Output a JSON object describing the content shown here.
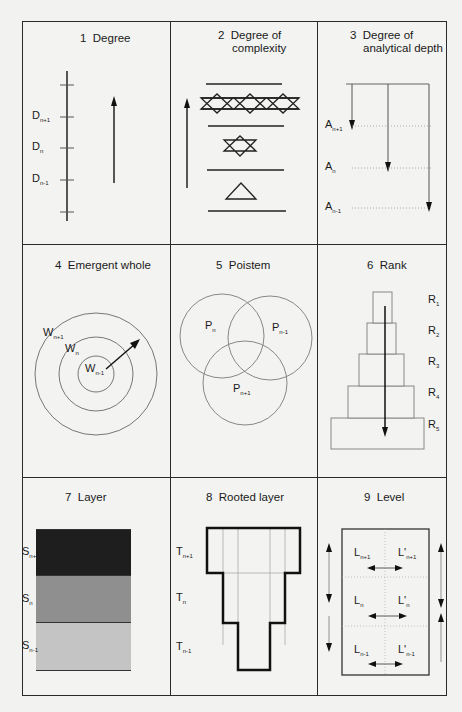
{
  "figure": {
    "panels": [
      {
        "id": 1,
        "title": "1  Degree",
        "labels": [
          {
            "base": "D",
            "sub": "n+1"
          },
          {
            "base": "D",
            "sub": "n"
          },
          {
            "base": "D",
            "sub": "n-1"
          }
        ]
      },
      {
        "id": 2,
        "title_line1": "2  Degree of",
        "title_line2": "complexity"
      },
      {
        "id": 3,
        "title_line1": "3  Degree of",
        "title_line2": "analytical depth",
        "labels": [
          {
            "base": "A",
            "sub": "n+1"
          },
          {
            "base": "A",
            "sub": "n"
          },
          {
            "base": "A",
            "sub": "n-1"
          }
        ]
      },
      {
        "id": 4,
        "title": "4  Emergent whole",
        "labels": [
          {
            "base": "W",
            "sub": "n+1"
          },
          {
            "base": "W",
            "sub": "n"
          },
          {
            "base": "W",
            "sub": "n-1"
          }
        ]
      },
      {
        "id": 5,
        "title": "5  Poistem",
        "labels": [
          {
            "base": "P",
            "sub": "n"
          },
          {
            "base": "P",
            "sub": "n-1"
          },
          {
            "base": "P",
            "sub": "n+1"
          }
        ]
      },
      {
        "id": 6,
        "title": "6  Rank",
        "labels": [
          {
            "base": "R",
            "sub": "1"
          },
          {
            "base": "R",
            "sub": "2"
          },
          {
            "base": "R",
            "sub": "3"
          },
          {
            "base": "R",
            "sub": "4"
          },
          {
            "base": "R",
            "sub": "5"
          }
        ]
      },
      {
        "id": 7,
        "title": "7  Layer",
        "labels": [
          {
            "base": "S",
            "sub": "n+1"
          },
          {
            "base": "S",
            "sub": "n"
          },
          {
            "base": "S",
            "sub": "n-1"
          }
        ],
        "colors": [
          "#1e1e1e",
          "#8f8f8f",
          "#c4c4c4"
        ]
      },
      {
        "id": 8,
        "title": "8  Rooted layer",
        "labels": [
          {
            "base": "T",
            "sub": "n+1"
          },
          {
            "base": "T",
            "sub": "n"
          },
          {
            "base": "T",
            "sub": "n-1"
          }
        ]
      },
      {
        "id": 9,
        "title": "9  Level",
        "labels": [
          {
            "base": "L",
            "sub": "n+1"
          },
          {
            "base": "L'",
            "sub": "n+1"
          },
          {
            "base": "L",
            "sub": "n"
          },
          {
            "base": "L'",
            "sub": "n"
          },
          {
            "base": "L",
            "sub": "n-1"
          },
          {
            "base": "L'",
            "sub": "n-1"
          }
        ]
      }
    ]
  }
}
